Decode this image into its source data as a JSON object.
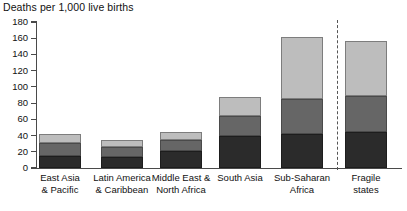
{
  "chart_data": {
    "type": "bar",
    "title": "Deaths per 1,000 live births",
    "subtitle": "",
    "xlabel": "",
    "ylabel": "",
    "ylim": [
      0,
      180
    ],
    "ytick_step": 20,
    "yticks": [
      180,
      160,
      140,
      120,
      100,
      80,
      60,
      40,
      20,
      0
    ],
    "ytick_labels": [
      "180",
      "160",
      "140",
      "120",
      "100",
      "80",
      "60",
      "40",
      "20",
      "0"
    ],
    "grid": false,
    "legend": "none",
    "stacked": true,
    "categories": [
      "East Asia\n& Pacific",
      "Latin America\n& Caribbean",
      "Middle East &\nNorth Africa",
      "South Asia",
      "Sub-Saharan\nAfrica",
      "Fragile\nstates"
    ],
    "category_lines": [
      [
        "East Asia",
        "& Pacific"
      ],
      [
        "Latin America",
        "& Caribbean"
      ],
      [
        "Middle East &",
        "North Africa"
      ],
      [
        "South Asia",
        ""
      ],
      [
        "Sub-Saharan",
        "Africa"
      ],
      [
        "Fragile",
        "states"
      ]
    ],
    "series": [
      {
        "name": "segment-bottom",
        "color": "#2b2b2b",
        "values": [
          15,
          14,
          21,
          40,
          42,
          44
        ]
      },
      {
        "name": "segment-middle",
        "color": "#666666",
        "values": [
          16,
          12,
          13,
          24,
          43,
          45
        ]
      },
      {
        "name": "segment-top",
        "color": "#bdbdbd",
        "values": [
          11,
          8,
          10,
          24,
          76,
          67
        ]
      }
    ],
    "totals": [
      42,
      34,
      44,
      88,
      161,
      156
    ],
    "annotations": [
      {
        "type": "vertical-dashed-divider",
        "after_category": "Sub-Saharan\nAfrica"
      }
    ]
  },
  "colors": {
    "axis": "#4a4a4a",
    "text": "#111111",
    "background": "#ffffff",
    "segment_bottom": "#2b2b2b",
    "segment_middle": "#666666",
    "segment_top": "#bdbdbd",
    "divider": "#555555"
  }
}
